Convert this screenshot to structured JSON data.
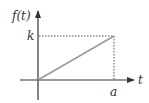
{
  "diagram": {
    "type": "ramp-function-graph",
    "labels": {
      "y_axis": "f(t)",
      "x_axis": "t",
      "y_level": "k",
      "x_level": "a"
    },
    "colors": {
      "axes": "#333333",
      "ramp": "#999999",
      "guides": "#555555",
      "background": "#ffffff"
    },
    "geometry": {
      "origin": [
        38,
        80
      ],
      "ramp_end": [
        114,
        36
      ]
    }
  }
}
